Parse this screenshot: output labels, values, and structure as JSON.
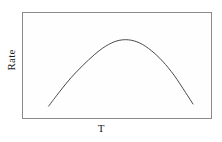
{
  "figure": {
    "name": "rate-vs-temperature-plot",
    "background_color": "#ffffff",
    "frame_color": "#8a8a8a",
    "curve_color": "#4a4a4a"
  },
  "axes": {
    "ylabel": "Rate",
    "xlabel": "T"
  },
  "chart_data": {
    "type": "line",
    "title": "",
    "subtitle": "",
    "xlabel": "T",
    "ylabel": "Rate",
    "xlim": [
      0,
      100
    ],
    "ylim": [
      0,
      100
    ],
    "grid": false,
    "legend": null,
    "tick_labels": {
      "x": [],
      "y": []
    },
    "annotations": [],
    "series": [
      {
        "name": "Rate",
        "color": "#4a4a4a",
        "style": "solid",
        "x": [
          14,
          20,
          26,
          32,
          38,
          44,
          50,
          56,
          62,
          68,
          74,
          80,
          86,
          90
        ],
        "y": [
          12,
          26,
          39,
          50,
          60,
          68,
          73,
          74,
          71,
          64,
          54,
          41,
          25,
          14
        ]
      }
    ]
  }
}
